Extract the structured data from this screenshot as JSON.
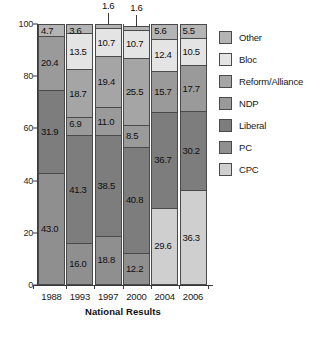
{
  "chart_data": {
    "type": "bar",
    "subtype": "stacked-bar-100",
    "title": "",
    "xlabel": "National Results",
    "ylabel": "",
    "ylim": [
      0,
      100
    ],
    "yticks": [
      0,
      20,
      40,
      60,
      80,
      100
    ],
    "grid": false,
    "legend_position": "right",
    "categories": [
      "1988",
      "1993",
      "1997",
      "2000",
      "2004",
      "2006"
    ],
    "series": [
      {
        "name": "PC",
        "color": "#8f8f8f",
        "values": [
          43.0,
          16.0,
          18.8,
          12.2,
          null,
          null
        ]
      },
      {
        "name": "Liberal",
        "color": "#7d7d7d",
        "values": [
          31.9,
          41.3,
          38.5,
          40.8,
          36.7,
          30.2
        ]
      },
      {
        "name": "NDP",
        "color": "#9a9a9a",
        "values": [
          20.4,
          6.9,
          11.0,
          8.5,
          15.7,
          17.7
        ]
      },
      {
        "name": "Reform/Alliance",
        "color": "#a5a5a5",
        "values": [
          null,
          18.7,
          19.4,
          25.5,
          null,
          null
        ]
      },
      {
        "name": "Bloc",
        "color": "#e4e4e4",
        "values": [
          null,
          13.5,
          10.7,
          10.7,
          12.4,
          10.5
        ]
      },
      {
        "name": "CPC",
        "color": "#cfcfcf",
        "values": [
          null,
          null,
          null,
          null,
          29.6,
          36.3
        ]
      },
      {
        "name": "Other",
        "color": "#b4b4b4",
        "values": [
          4.7,
          3.6,
          1.6,
          1.6,
          5.6,
          5.5
        ]
      }
    ],
    "stack_order_bottom_to_top": [
      "PC",
      "CPC",
      "Liberal",
      "NDP",
      "Reform/Alliance",
      "Bloc",
      "Other"
    ],
    "callout_labels": [
      {
        "category": "1997",
        "series": "Other",
        "value": "1.6"
      },
      {
        "category": "2000",
        "series": "Other",
        "value": "1.6"
      }
    ],
    "bars": [
      {
        "year": "1988",
        "segments": [
          {
            "name": "PC",
            "value": 43.0,
            "label": "43.0",
            "color": "#8f8f8f"
          },
          {
            "name": "Liberal",
            "value": 31.9,
            "label": "31.9",
            "color": "#7d7d7d"
          },
          {
            "name": "NDP",
            "value": 20.4,
            "label": "20.4",
            "color": "#9a9a9a"
          },
          {
            "name": "Other",
            "value": 4.7,
            "label": "4.7",
            "color": "#b4b4b4"
          }
        ]
      },
      {
        "year": "1993",
        "segments": [
          {
            "name": "PC",
            "value": 16.0,
            "label": "16.0",
            "color": "#8f8f8f"
          },
          {
            "name": "Liberal",
            "value": 41.3,
            "label": "41.3",
            "color": "#7d7d7d"
          },
          {
            "name": "NDP",
            "value": 6.9,
            "label": "6.9",
            "color": "#9a9a9a"
          },
          {
            "name": "Reform/Alliance",
            "value": 18.7,
            "label": "18.7",
            "color": "#a5a5a5"
          },
          {
            "name": "Bloc",
            "value": 13.5,
            "label": "13.5",
            "color": "#e4e4e4"
          },
          {
            "name": "Other",
            "value": 3.6,
            "label": "3.6",
            "color": "#b4b4b4"
          }
        ]
      },
      {
        "year": "1997",
        "segments": [
          {
            "name": "PC",
            "value": 18.8,
            "label": "18.8",
            "color": "#8f8f8f"
          },
          {
            "name": "Liberal",
            "value": 38.5,
            "label": "38.5",
            "color": "#7d7d7d"
          },
          {
            "name": "NDP",
            "value": 11.0,
            "label": "11.0",
            "color": "#9a9a9a"
          },
          {
            "name": "Reform/Alliance",
            "value": 19.4,
            "label": "19.4",
            "color": "#a5a5a5"
          },
          {
            "name": "Bloc",
            "value": 10.7,
            "label": "10.7",
            "color": "#e4e4e4"
          },
          {
            "name": "Other",
            "value": 1.6,
            "label": "1.6",
            "color": "#b4b4b4",
            "callout": true
          }
        ]
      },
      {
        "year": "2000",
        "segments": [
          {
            "name": "PC",
            "value": 12.2,
            "label": "12.2",
            "color": "#8f8f8f"
          },
          {
            "name": "Liberal",
            "value": 40.8,
            "label": "40.8",
            "color": "#7d7d7d"
          },
          {
            "name": "NDP",
            "value": 8.5,
            "label": "8.5",
            "color": "#9a9a9a"
          },
          {
            "name": "Reform/Alliance",
            "value": 25.5,
            "label": "25.5",
            "color": "#a5a5a5"
          },
          {
            "name": "Bloc",
            "value": 10.7,
            "label": "10.7",
            "color": "#e4e4e4"
          },
          {
            "name": "Other",
            "value": 1.6,
            "label": "1.6",
            "color": "#b4b4b4",
            "callout": true
          }
        ]
      },
      {
        "year": "2004",
        "segments": [
          {
            "name": "CPC",
            "value": 29.6,
            "label": "29.6",
            "color": "#cfcfcf"
          },
          {
            "name": "Liberal",
            "value": 36.7,
            "label": "36.7",
            "color": "#7d7d7d"
          },
          {
            "name": "NDP",
            "value": 15.7,
            "label": "15.7",
            "color": "#9a9a9a"
          },
          {
            "name": "Bloc",
            "value": 12.4,
            "label": "12.4",
            "color": "#e4e4e4"
          },
          {
            "name": "Other",
            "value": 5.6,
            "label": "5.6",
            "color": "#b4b4b4"
          }
        ]
      },
      {
        "year": "2006",
        "segments": [
          {
            "name": "CPC",
            "value": 36.3,
            "label": "36.3",
            "color": "#cfcfcf"
          },
          {
            "name": "Liberal",
            "value": 30.2,
            "label": "30.2",
            "color": "#7d7d7d"
          },
          {
            "name": "NDP",
            "value": 17.7,
            "label": "17.7",
            "color": "#9a9a9a"
          },
          {
            "name": "Bloc",
            "value": 10.5,
            "label": "10.5",
            "color": "#e4e4e4"
          },
          {
            "name": "Other",
            "value": 5.5,
            "label": "5.5",
            "color": "#b4b4b4"
          }
        ]
      }
    ],
    "legend": [
      {
        "label": "Other",
        "color": "#b4b4b4"
      },
      {
        "label": "Bloc",
        "color": "#e4e4e4"
      },
      {
        "label": "Reform/Alliance",
        "color": "#a5a5a5"
      },
      {
        "label": "NDP",
        "color": "#9a9a9a"
      },
      {
        "label": "Liberal",
        "color": "#7d7d7d"
      },
      {
        "label": "PC",
        "color": "#8f8f8f"
      },
      {
        "label": "CPC",
        "color": "#cfcfcf"
      }
    ]
  }
}
